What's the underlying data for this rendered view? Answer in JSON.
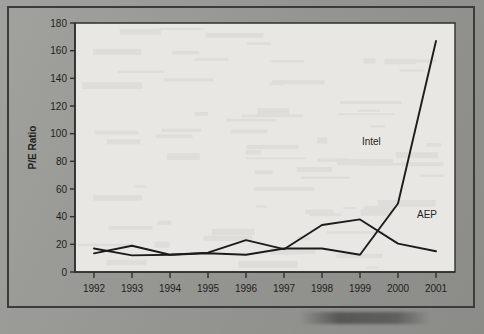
{
  "chart_data": {
    "type": "line",
    "title": "",
    "xlabel": "",
    "ylabel": "P/E Ratio",
    "x": [
      1992,
      1993,
      1994,
      1995,
      1996,
      1997,
      1998,
      1999,
      2000,
      2001
    ],
    "categories": [
      "1992",
      "1993",
      "1994",
      "1995",
      "1996",
      "1997",
      "1998",
      "1999",
      "2000",
      "2001"
    ],
    "ylim": [
      0,
      180
    ],
    "yticks": [
      0,
      20,
      40,
      60,
      80,
      100,
      120,
      140,
      160,
      180
    ],
    "ytick_labels": [
      "0",
      "20",
      "40",
      "60",
      "80",
      "100",
      "120",
      "140",
      "160",
      "180"
    ],
    "grid": false,
    "legend_position": "inline-annotation",
    "series": [
      {
        "name": "Intel",
        "values": [
          13.5,
          19,
          12.5,
          13.5,
          12.5,
          17,
          17,
          12.5,
          49.5,
          167
        ],
        "label": "Intel",
        "label_x": 1999.05,
        "label_y": 92
      },
      {
        "name": "AEP",
        "values": [
          17,
          12,
          12.5,
          14,
          23,
          16.5,
          34,
          38,
          20.5,
          15
        ],
        "label": "AEP",
        "label_x": 2000.5,
        "label_y": 39
      }
    ]
  },
  "axis": {
    "y_title": "P/E Ratio"
  },
  "annotations": {
    "intel": "Intel",
    "aep": "AEP"
  }
}
